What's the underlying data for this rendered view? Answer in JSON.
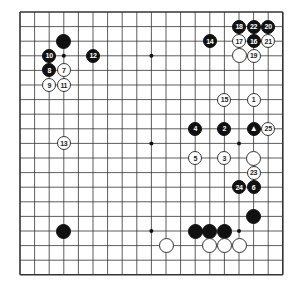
{
  "board": {
    "size": 19,
    "origin_x": 20,
    "origin_y": 12,
    "spacing": 14.6,
    "line_color": "#333333",
    "hoshi": [
      [
        3,
        3
      ],
      [
        9,
        3
      ],
      [
        15,
        3
      ],
      [
        3,
        9
      ],
      [
        9,
        9
      ],
      [
        15,
        9
      ],
      [
        3,
        15
      ],
      [
        9,
        15
      ],
      [
        15,
        15
      ]
    ]
  },
  "stones": [
    {
      "color": "black",
      "col": 3,
      "row": 2,
      "label": ""
    },
    {
      "color": "black",
      "col": 2,
      "row": 3,
      "label": "10"
    },
    {
      "color": "black",
      "col": 5,
      "row": 3,
      "label": "12"
    },
    {
      "color": "black",
      "col": 2,
      "row": 4,
      "label": "8"
    },
    {
      "color": "white",
      "col": 3,
      "row": 4,
      "label": "7"
    },
    {
      "color": "white",
      "col": 2,
      "row": 5,
      "label": "9"
    },
    {
      "color": "white",
      "col": 3,
      "row": 5,
      "label": "11"
    },
    {
      "color": "white",
      "col": 3,
      "row": 9,
      "label": "13"
    },
    {
      "color": "black",
      "col": 13,
      "row": 2,
      "label": "14"
    },
    {
      "color": "black",
      "col": 15,
      "row": 1,
      "label": "18"
    },
    {
      "color": "black",
      "col": 16,
      "row": 1,
      "label": "22"
    },
    {
      "color": "black",
      "col": 17,
      "row": 1,
      "label": "20"
    },
    {
      "color": "white",
      "col": 15,
      "row": 2,
      "label": "17"
    },
    {
      "color": "black",
      "col": 16,
      "row": 2,
      "label": "16"
    },
    {
      "color": "white",
      "col": 17,
      "row": 2,
      "label": "21"
    },
    {
      "color": "white",
      "col": 15,
      "row": 3,
      "label": ""
    },
    {
      "color": "white",
      "col": 16,
      "row": 3,
      "label": "19"
    },
    {
      "color": "white",
      "col": 14,
      "row": 6,
      "label": "15"
    },
    {
      "color": "white",
      "col": 16,
      "row": 6,
      "label": "1"
    },
    {
      "color": "black",
      "col": 12,
      "row": 8,
      "label": "4"
    },
    {
      "color": "black",
      "col": 14,
      "row": 8,
      "label": "2"
    },
    {
      "color": "black",
      "col": 16,
      "row": 8,
      "label": "▲"
    },
    {
      "color": "white",
      "col": 17,
      "row": 8,
      "label": "25"
    },
    {
      "color": "white",
      "col": 12,
      "row": 10,
      "label": "5"
    },
    {
      "color": "white",
      "col": 14,
      "row": 10,
      "label": "3"
    },
    {
      "color": "white",
      "col": 16,
      "row": 10,
      "label": ""
    },
    {
      "color": "white",
      "col": 16,
      "row": 11,
      "label": "23"
    },
    {
      "color": "black",
      "col": 15,
      "row": 12,
      "label": "24"
    },
    {
      "color": "black",
      "col": 16,
      "row": 12,
      "label": "6"
    },
    {
      "color": "black",
      "col": 16,
      "row": 14,
      "label": ""
    },
    {
      "color": "black",
      "col": 3,
      "row": 15,
      "label": ""
    },
    {
      "color": "black",
      "col": 12,
      "row": 15,
      "label": ""
    },
    {
      "color": "black",
      "col": 13,
      "row": 15,
      "label": ""
    },
    {
      "color": "black",
      "col": 14,
      "row": 15,
      "label": ""
    },
    {
      "color": "white",
      "col": 10,
      "row": 16,
      "label": ""
    },
    {
      "color": "white",
      "col": 13,
      "row": 16,
      "label": ""
    },
    {
      "color": "white",
      "col": 14,
      "row": 16,
      "label": ""
    },
    {
      "color": "white",
      "col": 15,
      "row": 16,
      "label": ""
    }
  ]
}
